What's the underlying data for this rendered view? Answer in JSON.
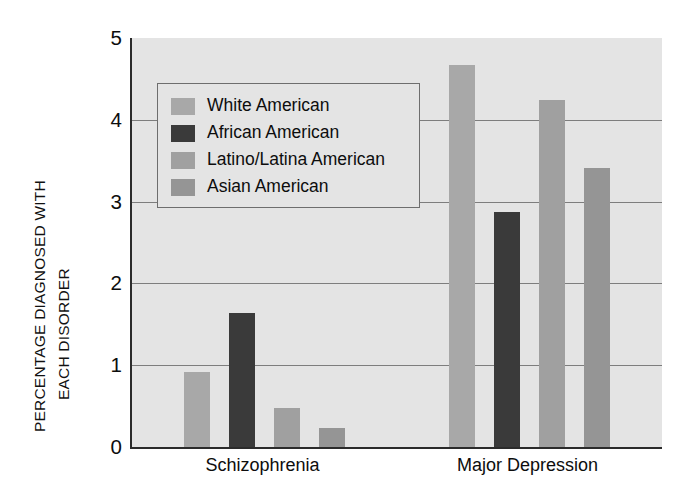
{
  "chart_data": {
    "type": "bar",
    "title": "",
    "xlabel": "",
    "ylabel_line1": "PERCENTAGE DIAGNOSED WITH",
    "ylabel_line2": "EACH DISORDER",
    "categories": [
      "Schizophrenia",
      "Major Depression"
    ],
    "series": [
      {
        "name": "White American",
        "color": "#a8a8a8",
        "values": [
          0.92,
          4.67
        ]
      },
      {
        "name": "African American",
        "color": "#3a3a3a",
        "values": [
          1.64,
          2.87
        ]
      },
      {
        "name": "Latino/Latina American",
        "color": "#a0a0a0",
        "values": [
          0.48,
          4.24
        ]
      },
      {
        "name": "Asian American",
        "color": "#959595",
        "values": [
          0.23,
          3.41
        ]
      }
    ],
    "ylim": [
      0,
      5
    ],
    "yticks": [
      "0",
      "1",
      "2",
      "3",
      "4",
      "5"
    ],
    "gridlines": [
      1,
      2,
      3,
      4
    ],
    "grid": true,
    "legend_position": "upper-left-inside",
    "plot_background": "#e4e4e4",
    "axis_color": "#2b2b2b",
    "grid_color": "#7d7d7d"
  },
  "legend": {
    "entries": [
      "White American",
      "African American",
      "Latino/Latina American",
      "Asian American"
    ]
  }
}
